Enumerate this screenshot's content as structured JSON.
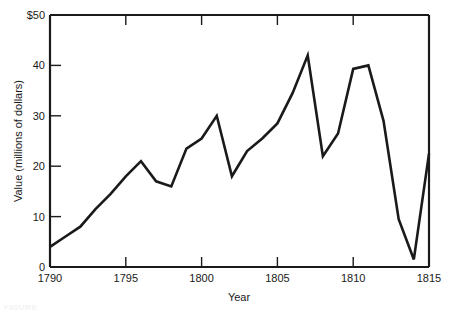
{
  "chart_data": {
    "type": "line",
    "title": "",
    "xlabel": "Year",
    "ylabel": "Value (millions of dollars)",
    "xlim": [
      1790,
      1815
    ],
    "ylim": [
      0,
      50
    ],
    "grid": false,
    "legend": null,
    "line_color": "#1a1a1a",
    "background_color": "#ffffff",
    "frame_color": "#1a1a1a",
    "x_ticks": [
      1790,
      1795,
      1800,
      1805,
      1810,
      1815
    ],
    "x_tick_labels": [
      "1790",
      "1795",
      "1800",
      "1805",
      "1810",
      "1815"
    ],
    "y_ticks": [
      0,
      10,
      20,
      30,
      40,
      50
    ],
    "y_tick_labels": [
      "0",
      "10",
      "20",
      "30",
      "40",
      "$50"
    ],
    "x": [
      1790,
      1791,
      1792,
      1793,
      1794,
      1795,
      1796,
      1797,
      1798,
      1799,
      1800,
      1801,
      1802,
      1803,
      1804,
      1805,
      1806,
      1807,
      1808,
      1809,
      1810,
      1811,
      1812,
      1813,
      1814,
      1815
    ],
    "values": [
      4.0,
      6.0,
      8.0,
      11.5,
      14.5,
      18.0,
      21.0,
      17.0,
      16.0,
      23.5,
      25.5,
      30.0,
      18.0,
      23.0,
      25.5,
      28.5,
      34.5,
      42.0,
      22.0,
      26.5,
      39.3,
      40.0,
      29.0,
      9.5,
      1.5,
      22.5
    ],
    "series_name": "Value"
  },
  "labels": {
    "y_axis_title": "Value (millions of dollars)",
    "x_axis_title": "Year",
    "y_0": "0",
    "y_10": "10",
    "y_20": "20",
    "y_30": "30",
    "y_40": "40",
    "y_50": "$50",
    "x_1790": "1790",
    "x_1795": "1795",
    "x_1800": "1800",
    "x_1805": "1805",
    "x_1810": "1810",
    "x_1815": "1815"
  },
  "caption": {
    "partial_text": "FIGURE"
  }
}
